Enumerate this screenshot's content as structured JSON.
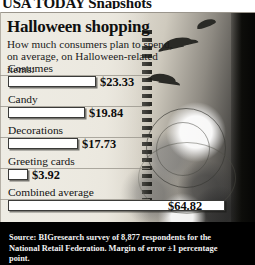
{
  "masthead": {
    "text": "USA TODAY Snapshots"
  },
  "header": {
    "title": "Halloween shopping",
    "subtitle": "How much consumers plan to spend, on average, on Halloween-related items:"
  },
  "source": {
    "line1": "Source: BIGresearch survey of 8,877 respondents for the National",
    "line2": "Retail Federation. Margin of error ±1 percentage point."
  },
  "colors": {
    "bar_fill": "#ffffff",
    "bar_outline": "#3a3a38",
    "panel_bg": "#e9e6de",
    "source_bg": "#000000",
    "text": "#111111"
  },
  "chart_data": {
    "type": "bar",
    "orientation": "horizontal",
    "title": "Halloween shopping",
    "subtitle": "How much consumers plan to spend, on average, on Halloween-related items:",
    "xlabel": "",
    "ylabel": "",
    "grid": false,
    "legend": false,
    "xlim": [
      0,
      64.82
    ],
    "value_prefix": "$",
    "categories": [
      "Costumes",
      "Candy",
      "Decorations",
      "Greeting cards",
      "Combined average"
    ],
    "values": [
      23.33,
      19.84,
      17.73,
      3.92,
      64.82
    ],
    "value_labels": [
      "$23.33",
      "$19.84",
      "$17.73",
      "$3.92",
      "$64.82"
    ],
    "bars": [
      {
        "label": "Costumes",
        "value": 23.33,
        "value_label": "$23.33",
        "width_px": 88,
        "label_top": 0,
        "bar_top": 14,
        "value_left": 100
      },
      {
        "label": "Candy",
        "value": 19.84,
        "value_label": "$19.84",
        "width_px": 77,
        "label_top": 31,
        "bar_top": 45,
        "value_left": 89
      },
      {
        "label": "Decorations",
        "value": 17.73,
        "value_label": "$17.73",
        "width_px": 70,
        "label_top": 62,
        "bar_top": 76,
        "value_left": 82
      },
      {
        "label": "Greeting cards",
        "value": 3.92,
        "value_label": "$3.92",
        "width_px": 20,
        "label_top": 93,
        "bar_top": 107,
        "value_left": 32
      },
      {
        "label": "Combined average",
        "value": 64.82,
        "value_label": "$64.82",
        "width_px": 217,
        "label_top": 124,
        "bar_top": 138,
        "value_left": 168
      }
    ]
  }
}
